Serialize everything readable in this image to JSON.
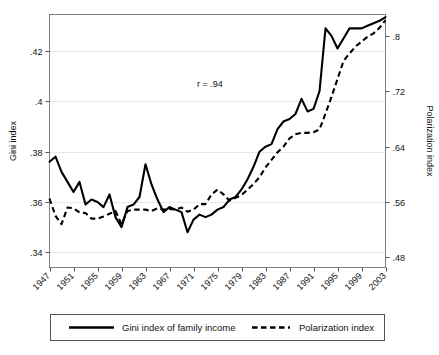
{
  "chart_data": {
    "type": "line",
    "title": "",
    "xlabel": "",
    "ylabel": "Gini index",
    "y2label": "Polarization index",
    "annotation": "r = .94",
    "grid": true,
    "legend_position": "bottom",
    "xlim": [
      1947,
      2003
    ],
    "ylim": [
      0.334,
      0.4345
    ],
    "y2lim": [
      0.4653,
      0.8313
    ],
    "xticks": [
      "1947",
      "1951",
      "1955",
      "1959",
      "1963",
      "1967",
      "1971",
      "1975",
      "1979",
      "1983",
      "1987",
      "1991",
      "1995",
      "1999",
      "2003"
    ],
    "yticks": [
      ".34",
      ".36",
      ".38",
      ".4",
      ".42"
    ],
    "ytick_values": [
      0.34,
      0.36,
      0.38,
      0.4,
      0.42
    ],
    "y2ticks": [
      ".48",
      ".56",
      ".64",
      ".72",
      ".8"
    ],
    "y2tick_values": [
      0.48,
      0.56,
      0.64,
      0.72,
      0.8
    ],
    "x": [
      1947,
      1948,
      1949,
      1950,
      1951,
      1952,
      1953,
      1954,
      1955,
      1956,
      1957,
      1958,
      1959,
      1960,
      1961,
      1962,
      1963,
      1964,
      1965,
      1966,
      1967,
      1968,
      1969,
      1970,
      1971,
      1972,
      1973,
      1974,
      1975,
      1976,
      1977,
      1978,
      1979,
      1980,
      1981,
      1982,
      1983,
      1984,
      1985,
      1986,
      1987,
      1988,
      1989,
      1990,
      1991,
      1992,
      1993,
      1994,
      1995,
      1996,
      1997,
      1998,
      1999,
      2000,
      2001,
      2002,
      2003
    ],
    "series": [
      {
        "name": "Gini index of family income",
        "style": "solid",
        "axis": "left",
        "values": [
          0.376,
          0.378,
          0.372,
          0.368,
          0.364,
          0.368,
          0.359,
          0.361,
          0.36,
          0.358,
          0.363,
          0.354,
          0.35,
          0.358,
          0.359,
          0.362,
          0.375,
          0.367,
          0.361,
          0.356,
          0.358,
          0.357,
          0.356,
          0.348,
          0.353,
          0.355,
          0.354,
          0.355,
          0.357,
          0.358,
          0.361,
          0.362,
          0.365,
          0.369,
          0.374,
          0.38,
          0.382,
          0.383,
          0.389,
          0.392,
          0.393,
          0.395,
          0.401,
          0.396,
          0.397,
          0.404,
          0.429,
          0.426,
          0.421,
          0.425,
          0.429,
          0.429,
          0.429,
          0.43,
          0.431,
          0.432,
          0.4335
        ]
      },
      {
        "name": "Polarization index",
        "style": "dashed",
        "axis": "right",
        "values": [
          0.565,
          0.54,
          0.528,
          0.552,
          0.551,
          0.545,
          0.544,
          0.536,
          0.536,
          0.539,
          0.543,
          0.547,
          0.528,
          0.547,
          0.549,
          0.549,
          0.549,
          0.547,
          0.551,
          0.549,
          0.55,
          0.549,
          0.552,
          0.546,
          0.549,
          0.557,
          0.557,
          0.571,
          0.578,
          0.571,
          0.562,
          0.566,
          0.57,
          0.578,
          0.586,
          0.596,
          0.61,
          0.621,
          0.632,
          0.64,
          0.652,
          0.658,
          0.66,
          0.66,
          0.661,
          0.665,
          0.688,
          0.712,
          0.738,
          0.764,
          0.775,
          0.785,
          0.792,
          0.799,
          0.804,
          0.812,
          0.823
        ]
      }
    ]
  },
  "legend": {
    "entries": [
      {
        "label": "Gini index of family income",
        "style": "solid"
      },
      {
        "label": "Polarization index",
        "style": "dashed"
      }
    ]
  },
  "axes": {
    "left_title": "Gini index",
    "right_title": "Polarization index"
  },
  "annotation": {
    "correlation_text": "r = .94"
  }
}
